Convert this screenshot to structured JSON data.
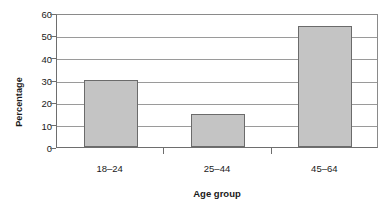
{
  "chart_data": {
    "type": "bar",
    "title": "",
    "subtitle": "",
    "categories": [
      "18–24",
      "25–44",
      "45–64"
    ],
    "values": [
      30,
      15,
      54
    ],
    "xlabel": "Age group",
    "ylabel": "Percentage",
    "ylim": [
      0,
      60
    ],
    "yticks": [
      0,
      10,
      20,
      30,
      40,
      50,
      60
    ],
    "ytick_labels": [
      "0",
      "10",
      "20",
      "30",
      "40",
      "50",
      "60"
    ],
    "grid": "horizontal",
    "legend": "none",
    "bar_fill_color": "#c4c4c4",
    "bar_border_color": "#6b6b6b",
    "gridline_color": "#9a9a9a",
    "axis_color": "#6e6e6e",
    "background_color": "#ffffff",
    "annotations": []
  }
}
